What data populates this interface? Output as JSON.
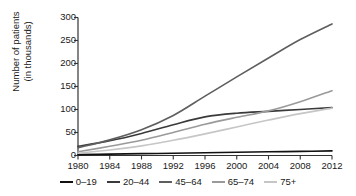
{
  "chart_data": {
    "type": "line",
    "title": "",
    "xlabel": "",
    "ylabel": "Number of patients\n(in thousands)",
    "xlim": [
      1980,
      2012
    ],
    "ylim": [
      0,
      300
    ],
    "xticks": [
      "1980",
      "1984",
      "1988",
      "1992",
      "1996",
      "2000",
      "2004",
      "2008",
      "2012"
    ],
    "yticks": [
      "0",
      "50",
      "100",
      "150",
      "200",
      "250",
      "300"
    ],
    "grid": false,
    "legend_position": "bottom",
    "x": [
      1980,
      1984,
      1988,
      1992,
      1996,
      2000,
      2004,
      2008,
      2012
    ],
    "series": [
      {
        "name": "0–19",
        "color": "#111111",
        "values": [
          2,
          3,
          4,
          5,
          6,
          7,
          8,
          9,
          10
        ]
      },
      {
        "name": "20–44",
        "color": "#3a3a3a",
        "values": [
          20,
          32,
          48,
          67,
          84,
          92,
          96,
          100,
          104
        ]
      },
      {
        "name": "45–64",
        "color": "#5e5e5e",
        "values": [
          17,
          34,
          56,
          87,
          129,
          171,
          212,
          252,
          286
        ]
      },
      {
        "name": "65–74",
        "color": "#9a9a9a",
        "values": [
          8,
          20,
          33,
          50,
          68,
          83,
          97,
          117,
          141
        ]
      },
      {
        "name": "75+",
        "color": "#c6c6c6",
        "values": [
          5,
          12,
          21,
          33,
          47,
          62,
          77,
          91,
          103
        ]
      }
    ]
  },
  "legend": {
    "items": [
      {
        "label": "0–19",
        "color": "#111111"
      },
      {
        "label": "20–44",
        "color": "#3a3a3a"
      },
      {
        "label": "45–64",
        "color": "#5e5e5e"
      },
      {
        "label": "65–74",
        "color": "#9a9a9a"
      },
      {
        "label": "75+",
        "color": "#c6c6c6"
      }
    ]
  },
  "axes": {
    "axis_color": "#333333",
    "y_title_line1": "Number of patients",
    "y_title_line2": "(in thousands)"
  }
}
